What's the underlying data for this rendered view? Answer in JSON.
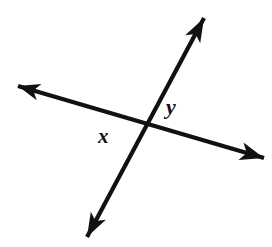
{
  "figure": {
    "kind": "geometry-diagram",
    "background_color": "#ffffff",
    "stroke_color": "#111111",
    "canvas": {
      "width": 272,
      "height": 247
    }
  },
  "geometry": {
    "intersection": {
      "x": 141,
      "y": 124
    },
    "lines": [
      {
        "id": "line-shallow",
        "name": "shallow-line",
        "stroke_width": 4.2,
        "start": {
          "x": 18,
          "y": 86
        },
        "end": {
          "x": 264,
          "y": 158
        },
        "arrow_start": true,
        "arrow_end": true
      },
      {
        "id": "line-steep",
        "name": "steep-line",
        "stroke_width": 4.2,
        "start": {
          "x": 87,
          "y": 237
        },
        "end": {
          "x": 204,
          "y": 18
        },
        "arrow_start": true,
        "arrow_end": true
      }
    ],
    "arrowheads": [
      {
        "id": "arrow-upper-left",
        "tip": {
          "x": 18,
          "y": 86
        }
      },
      {
        "id": "arrow-lower-right",
        "tip": {
          "x": 264,
          "y": 158
        }
      },
      {
        "id": "arrow-upper-right",
        "tip": {
          "x": 204,
          "y": 18
        }
      },
      {
        "id": "arrow-lower-left",
        "tip": {
          "x": 87,
          "y": 237
        }
      }
    ]
  },
  "labels": {
    "x": {
      "text": "x",
      "position": {
        "x": 106,
        "y": 139
      },
      "font_size": 21
    },
    "y": {
      "text": "y",
      "position": {
        "x": 174,
        "y": 109
      },
      "font_size": 22
    }
  }
}
